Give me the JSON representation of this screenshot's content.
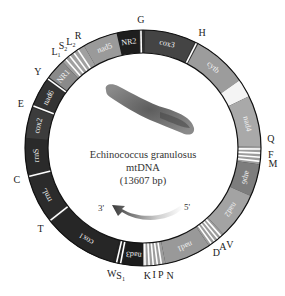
{
  "title": {
    "species": "Echinococcus granulosus",
    "molecule": "mtDNA",
    "size": "(13607 bp)"
  },
  "strand": {
    "left": "3'",
    "right": "5'"
  },
  "ring": {
    "cx": 143,
    "cy": 148,
    "r_outer": 118,
    "r_inner": 95
  },
  "colors": {
    "dark": "#262626",
    "mid": "#555555",
    "light": "#9a9a9a",
    "lighter": "#a8a8a8",
    "trna": "#ffffff",
    "outline": "#111111"
  },
  "segments": [
    {
      "name": "NR2",
      "start": -13,
      "end": -2,
      "color": "#1e1e1e",
      "label_angle": -7.5
    },
    {
      "name": "cox3",
      "start": 1,
      "end": 26,
      "color": "#444444",
      "label_angle": 13
    },
    {
      "name": "cytb",
      "start": 28,
      "end": 55,
      "color": "#9c9c9c",
      "label_angle": 41
    },
    {
      "name": "gap",
      "start": 55,
      "end": 64,
      "color": "#f4f4f4",
      "label_angle": null
    },
    {
      "name": "nad4",
      "start": 64,
      "end": 89,
      "color": "#a9a9a9",
      "label_angle": 77
    },
    {
      "name": "atp6",
      "start": 98,
      "end": 114,
      "color": "#7d7d7d",
      "label_angle": 106
    },
    {
      "name": "nad2",
      "start": 114,
      "end": 137,
      "color": "#a3a3a3",
      "label_angle": 125
    },
    {
      "name": "nad1",
      "start": 146,
      "end": 169,
      "color": "#999999",
      "label_angle": 157
    },
    {
      "name": "nad3",
      "start": 180,
      "end": 190,
      "color": "#1c1c1c",
      "label_angle": 185
    },
    {
      "name": "cox1",
      "start": 195,
      "end": 231,
      "color": "#262626",
      "label_angle": 212
    },
    {
      "name": "rrnL",
      "start": 233,
      "end": 255,
      "color": "#2b2b2b",
      "label_angle": 244
    },
    {
      "name": "rrnS",
      "start": 257,
      "end": 275,
      "color": "#2a2a2a",
      "label_angle": 266
    },
    {
      "name": "cox2",
      "start": 275,
      "end": 290,
      "color": "#3c3c3c",
      "label_angle": 282
    },
    {
      "name": "nad6",
      "start": 292,
      "end": 305,
      "color": "#333333",
      "label_angle": 298
    },
    {
      "name": "NR1",
      "start": 307,
      "end": 317,
      "color": "#8a8a8a",
      "label_angle": 312
    },
    {
      "name": "nad5",
      "start": 330,
      "end": 347,
      "color": "#9a9a9a",
      "label_angle": 339
    }
  ],
  "fills": [
    {
      "start": 89,
      "end": 98,
      "color": "#9c9c9c"
    },
    {
      "start": 137,
      "end": 146,
      "color": "#9c9c9c"
    },
    {
      "start": 169,
      "end": 180,
      "color": "#9c9c9c"
    },
    {
      "start": 190,
      "end": 195,
      "color": "#222222"
    },
    {
      "start": 317,
      "end": 330,
      "color": "#a0a0a0"
    },
    {
      "start": 347,
      "end": 347,
      "color": "#9a9a9a"
    }
  ],
  "trna_lines": [
    -1,
    27,
    90.5,
    92.5,
    94.5,
    96.5,
    138.5,
    140.5,
    142.5,
    144.5,
    171,
    173,
    175,
    177,
    179,
    191,
    193,
    232,
    256,
    291,
    306,
    319,
    321.5,
    324,
    326.5
  ],
  "trna_labels": [
    {
      "text": "G",
      "angle": -1,
      "r": 129
    },
    {
      "text": "H",
      "angle": 27,
      "r": 130
    },
    {
      "text": "Q",
      "angle": 89,
      "r": 128,
      "dy": -7
    },
    {
      "text": "F",
      "angle": 93,
      "r": 128
    },
    {
      "text": "M",
      "angle": 97,
      "r": 131
    },
    {
      "text": "V",
      "angle": 138,
      "r": 130
    },
    {
      "text": "A",
      "angle": 141,
      "r": 127
    },
    {
      "text": "D",
      "angle": 145,
      "r": 128
    },
    {
      "text": "N",
      "angle": 168,
      "r": 130
    },
    {
      "text": "P",
      "angle": 172,
      "r": 128
    },
    {
      "text": "I",
      "angle": 175,
      "r": 127
    },
    {
      "text": "K",
      "angle": 178,
      "r": 128
    },
    {
      "text": "S1",
      "angle": 190,
      "r": 129,
      "sub": true
    },
    {
      "text": "W",
      "angle": 194,
      "r": 129
    },
    {
      "text": "T",
      "angle": 232,
      "r": 130
    },
    {
      "text": "C",
      "angle": 256,
      "r": 130
    },
    {
      "text": "E",
      "angle": 290,
      "r": 130
    },
    {
      "text": "Y",
      "angle": 306,
      "r": 130
    },
    {
      "text": "L1",
      "angle": 318,
      "r": 130,
      "sub": true
    },
    {
      "text": "S2",
      "angle": 322,
      "r": 130,
      "sub": true
    },
    {
      "text": "L2",
      "angle": 326,
      "r": 129,
      "sub": true
    },
    {
      "text": "R",
      "angle": 330,
      "r": 130
    }
  ]
}
